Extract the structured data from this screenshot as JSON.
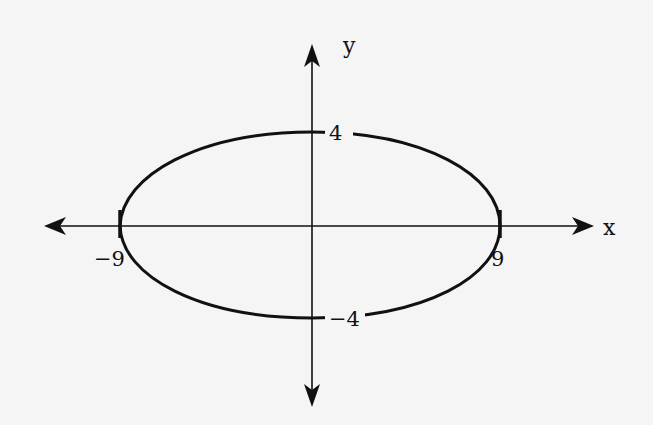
{
  "diagram": {
    "type": "ellipse-graph",
    "equation_semi_axes": {
      "a": 9,
      "b": 4
    },
    "axes": {
      "x_label": "x",
      "y_label": "y"
    },
    "intercept_labels": {
      "top": "4",
      "bottom": "−4",
      "left": "−9",
      "right": "9"
    },
    "colors": {
      "background": "#f5f5f5",
      "stroke": "#111111"
    }
  }
}
